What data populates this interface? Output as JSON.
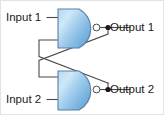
{
  "diagram": {
    "background_color": "#ffffff",
    "border_color": "#e3e3e3",
    "wire_color": "#4a4a4a",
    "gate_outline_color": "#5c7fa3",
    "gate_fill_light": "#eaf4fc",
    "gate_fill_mid": "#9fcbeb",
    "gate_fill_dark": "#5d9fd4",
    "labels": {
      "input_1": "Input 1",
      "input_2": "Input 2",
      "output_1": "Output 1",
      "output_2": "Output 2"
    },
    "gates": [
      {
        "name": "nand-gate-top",
        "type": "NAND",
        "inverting_bubble": true
      },
      {
        "name": "nand-gate-bottom",
        "type": "NAND",
        "inverting_bubble": true
      }
    ]
  }
}
